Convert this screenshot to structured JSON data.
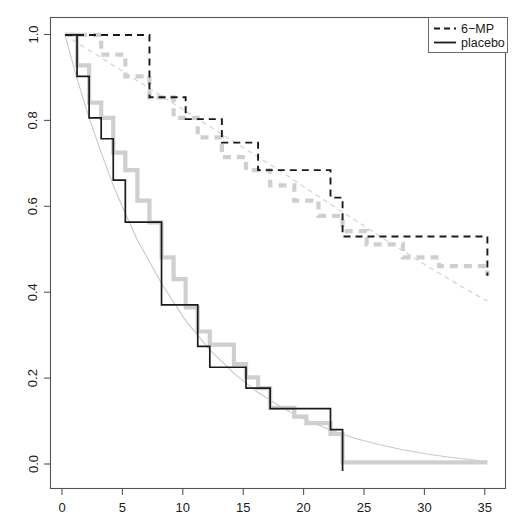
{
  "chart_data": {
    "type": "line",
    "title": "",
    "subtitle": "",
    "xlabel": "",
    "ylabel": "",
    "xlim": [
      -1.2,
      36.5
    ],
    "ylim": [
      -0.04,
      1.04
    ],
    "grid": false,
    "legend_position": "top-right",
    "x_ticks": [
      0,
      5,
      10,
      15,
      20,
      25,
      30,
      35
    ],
    "x_tick_labels": [
      "0",
      "5",
      "10",
      "15",
      "20",
      "25",
      "30",
      "35"
    ],
    "y_ticks": [
      0.0,
      0.2,
      0.4,
      0.6,
      0.8,
      1.0
    ],
    "y_tick_labels": [
      "0.0",
      "0.2",
      "0.4",
      "0.6",
      "0.8",
      "1.0"
    ],
    "series": [
      {
        "name": "6-MP",
        "style": "dashed",
        "color": "#1a1a1a",
        "kind": "step",
        "x": [
          0,
          6,
          7,
          10,
          13,
          16,
          22,
          23,
          35
        ],
        "y": [
          1.0,
          1.0,
          0.857,
          0.807,
          0.753,
          0.69,
          0.627,
          0.538,
          0.448
        ]
      },
      {
        "name": "placebo",
        "style": "solid",
        "color": "#1a1a1a",
        "kind": "step",
        "x": [
          0,
          1,
          2,
          3,
          4,
          5,
          8,
          11,
          12,
          15,
          17,
          22,
          23
        ],
        "y": [
          1.0,
          0.905,
          0.81,
          0.762,
          0.667,
          0.571,
          0.381,
          0.286,
          0.238,
          0.19,
          0.143,
          0.095,
          0.0
        ]
      },
      {
        "name": "6-MP-alternative-estimate",
        "style": "dashed-thick-gray",
        "color": "#cfcfcf",
        "kind": "step",
        "x": [
          0,
          3,
          5,
          7,
          9,
          11,
          13,
          15,
          17,
          19,
          21,
          23,
          25,
          28,
          31,
          35
        ],
        "y": [
          1.0,
          0.955,
          0.905,
          0.857,
          0.81,
          0.765,
          0.72,
          0.69,
          0.655,
          0.62,
          0.585,
          0.55,
          0.52,
          0.49,
          0.47,
          0.448
        ]
      },
      {
        "name": "placebo-alternative-estimate",
        "style": "solid-thick-gray",
        "color": "#cfcfcf",
        "kind": "step",
        "x": [
          0,
          1,
          2,
          3,
          4,
          5,
          6,
          7,
          8,
          9,
          10,
          11,
          12,
          14,
          15,
          16,
          17,
          19,
          20,
          22,
          23,
          35
        ],
        "y": [
          1.0,
          0.93,
          0.845,
          0.81,
          0.73,
          0.69,
          0.62,
          0.57,
          0.49,
          0.44,
          0.375,
          0.32,
          0.29,
          0.245,
          0.215,
          0.19,
          0.145,
          0.125,
          0.11,
          0.085,
          0.02,
          0.02
        ]
      },
      {
        "name": "6-MP-smooth-fit",
        "style": "dashed-thin-gray",
        "color": "#d2d2d2",
        "kind": "smooth",
        "x": [
          0,
          2,
          4,
          6,
          8,
          10,
          12,
          14,
          16,
          18,
          20,
          22,
          24,
          26,
          28,
          30,
          32,
          34,
          35
        ],
        "y": [
          1.0,
          0.965,
          0.93,
          0.895,
          0.86,
          0.825,
          0.79,
          0.755,
          0.72,
          0.685,
          0.648,
          0.612,
          0.576,
          0.54,
          0.505,
          0.47,
          0.437,
          0.405,
          0.39
        ]
      },
      {
        "name": "placebo-smooth-fit",
        "style": "solid-thin-gray",
        "color": "#c8c8c8",
        "kind": "smooth",
        "x": [
          0,
          1,
          2,
          3,
          4,
          5,
          6,
          8,
          10,
          12,
          14,
          16,
          18,
          20,
          22,
          24,
          26,
          28,
          30,
          32,
          35
        ],
        "y": [
          1.0,
          0.9,
          0.81,
          0.73,
          0.655,
          0.59,
          0.53,
          0.43,
          0.345,
          0.278,
          0.224,
          0.18,
          0.145,
          0.117,
          0.094,
          0.075,
          0.061,
          0.049,
          0.039,
          0.031,
          0.022
        ]
      }
    ]
  },
  "legend": {
    "entries": [
      {
        "label": "6−MP",
        "style": "dashed"
      },
      {
        "label": "placebo",
        "style": "solid"
      }
    ]
  },
  "axes": {
    "x_tick_labels": [
      "0",
      "5",
      "10",
      "15",
      "20",
      "25",
      "30",
      "35"
    ],
    "y_tick_labels": [
      "0.0",
      "0.2",
      "0.4",
      "0.6",
      "0.8",
      "1.0"
    ]
  }
}
